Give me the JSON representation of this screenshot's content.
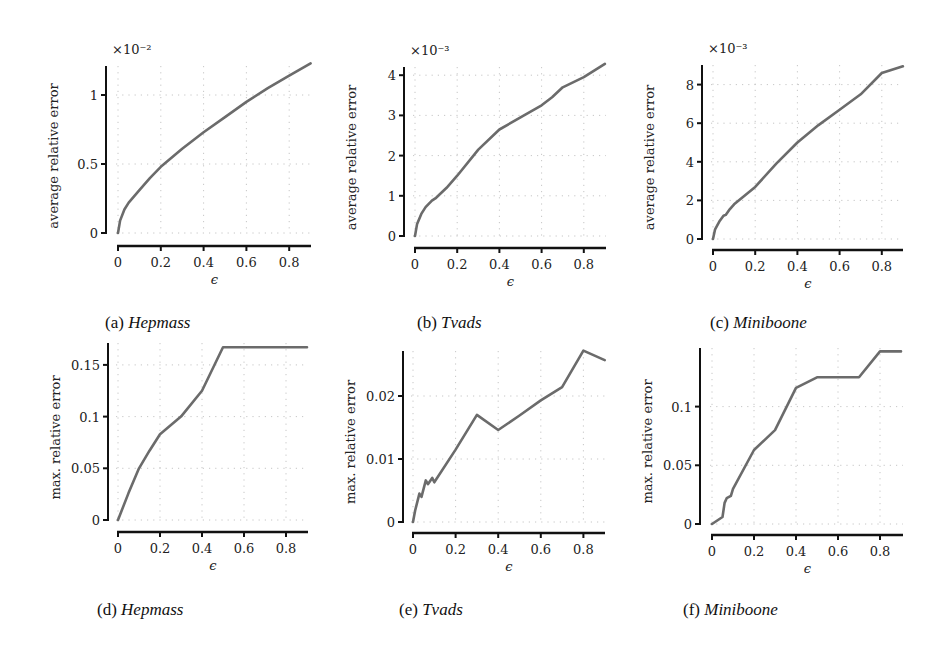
{
  "figure": {
    "panels": [
      {
        "id": "a",
        "caption_letter": "(a)",
        "caption_name": "Hepmass"
      },
      {
        "id": "b",
        "caption_letter": "(b)",
        "caption_name": "Tvads"
      },
      {
        "id": "c",
        "caption_letter": "(c)",
        "caption_name": "Miniboone"
      },
      {
        "id": "d",
        "caption_letter": "(d)",
        "caption_name": "Hepmass"
      },
      {
        "id": "e",
        "caption_letter": "(e)",
        "caption_name": "Tvads"
      },
      {
        "id": "f",
        "caption_letter": "(f)",
        "caption_name": "Miniboone"
      }
    ],
    "line_color": "#6b6b6b",
    "axis_color": "#111111",
    "grid_color": "#b8b8b8"
  },
  "chart_data": [
    {
      "panel": "a",
      "type": "line",
      "title": "(a) Hepmass",
      "xlabel": "ϵ",
      "ylabel": "average relative error",
      "y_multiplier": "×10⁻²",
      "xlim": [
        0,
        0.9
      ],
      "ylim": [
        0,
        1.21
      ],
      "xticks": [
        0,
        0.2,
        0.4,
        0.6,
        0.8
      ],
      "xtick_labels": [
        "0",
        "0.2",
        "0.4",
        "0.6",
        "0.8"
      ],
      "yticks": [
        0,
        0.5,
        1
      ],
      "ytick_labels": [
        "0",
        "0.5",
        "1"
      ],
      "grid": true,
      "series": [
        {
          "name": "Hepmass",
          "x": [
            0,
            0.01,
            0.03,
            0.05,
            0.1,
            0.15,
            0.2,
            0.3,
            0.4,
            0.5,
            0.6,
            0.7,
            0.8,
            0.9
          ],
          "y": [
            0,
            0.09,
            0.17,
            0.22,
            0.31,
            0.4,
            0.48,
            0.61,
            0.73,
            0.84,
            0.95,
            1.05,
            1.14,
            1.23
          ]
        }
      ]
    },
    {
      "panel": "b",
      "type": "line",
      "title": "(b) Tvads",
      "xlabel": "ϵ",
      "ylabel": "average relative error",
      "y_multiplier": "×10⁻³",
      "xlim": [
        0,
        0.9
      ],
      "ylim": [
        0,
        4.25
      ],
      "xticks": [
        0,
        0.2,
        0.4,
        0.6,
        0.8
      ],
      "xtick_labels": [
        "0",
        "0.2",
        "0.4",
        "0.6",
        "0.8"
      ],
      "yticks": [
        0,
        1,
        2,
        3,
        4
      ],
      "ytick_labels": [
        "0",
        "1",
        "2",
        "3",
        "4"
      ],
      "grid": true,
      "series": [
        {
          "name": "Tvads",
          "x": [
            0,
            0.01,
            0.03,
            0.05,
            0.08,
            0.1,
            0.15,
            0.2,
            0.3,
            0.4,
            0.5,
            0.6,
            0.65,
            0.7,
            0.8,
            0.9
          ],
          "y": [
            0,
            0.3,
            0.55,
            0.72,
            0.88,
            0.95,
            1.2,
            1.5,
            2.15,
            2.65,
            2.95,
            3.25,
            3.45,
            3.7,
            3.95,
            4.28
          ]
        }
      ]
    },
    {
      "panel": "c",
      "type": "line",
      "title": "(c) Miniboone",
      "xlabel": "ϵ",
      "ylabel": "average relative error",
      "y_multiplier": "×10⁻³",
      "xlim": [
        0,
        0.9
      ],
      "ylim": [
        0,
        9
      ],
      "xticks": [
        0,
        0.2,
        0.4,
        0.6,
        0.8
      ],
      "xtick_labels": [
        "0",
        "0.2",
        "0.4",
        "0.6",
        "0.8"
      ],
      "yticks": [
        0,
        2,
        4,
        6,
        8
      ],
      "ytick_labels": [
        "0",
        "2",
        "4",
        "6",
        "8"
      ],
      "grid": true,
      "series": [
        {
          "name": "Miniboone",
          "x": [
            0,
            0.01,
            0.03,
            0.05,
            0.06,
            0.08,
            0.1,
            0.2,
            0.3,
            0.4,
            0.5,
            0.6,
            0.7,
            0.8,
            0.9
          ],
          "y": [
            0,
            0.5,
            0.9,
            1.2,
            1.25,
            1.55,
            1.8,
            2.7,
            3.9,
            5.0,
            5.9,
            6.7,
            7.5,
            8.6,
            8.95
          ]
        }
      ]
    },
    {
      "panel": "d",
      "type": "line",
      "title": "(d) Hepmass",
      "xlabel": "ϵ",
      "ylabel": "max. relative error",
      "xlim": [
        0,
        0.9
      ],
      "ylim": [
        0,
        0.172
      ],
      "xticks": [
        0,
        0.2,
        0.4,
        0.6,
        0.8
      ],
      "xtick_labels": [
        "0",
        "0.2",
        "0.4",
        "0.6",
        "0.8"
      ],
      "yticks": [
        0,
        0.05,
        0.1,
        0.15
      ],
      "ytick_labels": [
        "0",
        "0.05",
        "0.1",
        "0.15"
      ],
      "grid": true,
      "series": [
        {
          "name": "Hepmass",
          "x": [
            0,
            0.05,
            0.1,
            0.15,
            0.2,
            0.3,
            0.4,
            0.5,
            0.6,
            0.7,
            0.8,
            0.9
          ],
          "y": [
            0,
            0.026,
            0.05,
            0.067,
            0.083,
            0.1,
            0.125,
            0.167,
            0.167,
            0.167,
            0.167,
            0.167
          ]
        }
      ]
    },
    {
      "panel": "e",
      "type": "line",
      "title": "(e) Tvads",
      "xlabel": "ϵ",
      "ylabel": "max. relative error",
      "xlim": [
        0,
        0.9
      ],
      "ylim": [
        0,
        0.0275
      ],
      "xticks": [
        0,
        0.2,
        0.4,
        0.6,
        0.8
      ],
      "xtick_labels": [
        "0",
        "0.2",
        "0.4",
        "0.6",
        "0.8"
      ],
      "yticks": [
        0,
        0.01,
        0.02
      ],
      "ytick_labels": [
        "0",
        "0.01",
        "0.02"
      ],
      "grid": true,
      "series": [
        {
          "name": "Tvads",
          "x": [
            0,
            0.01,
            0.03,
            0.04,
            0.06,
            0.07,
            0.09,
            0.1,
            0.2,
            0.3,
            0.4,
            0.5,
            0.6,
            0.7,
            0.8,
            0.9
          ],
          "y": [
            0,
            0.0018,
            0.0045,
            0.004,
            0.0066,
            0.006,
            0.007,
            0.0063,
            0.0115,
            0.017,
            0.0146,
            0.0169,
            0.0193,
            0.0214,
            0.0272,
            0.0257
          ]
        }
      ]
    },
    {
      "panel": "f",
      "type": "line",
      "title": "(f) Miniboone",
      "xlabel": "ϵ",
      "ylabel": "max. relative error",
      "xlim": [
        0,
        0.9
      ],
      "ylim": [
        0,
        0.15
      ],
      "xticks": [
        0,
        0.2,
        0.4,
        0.6,
        0.8
      ],
      "xtick_labels": [
        "0",
        "0.2",
        "0.4",
        "0.6",
        "0.8"
      ],
      "yticks": [
        0,
        0.05,
        0.1
      ],
      "ytick_labels": [
        "0",
        "0.05",
        "0.1"
      ],
      "grid": true,
      "series": [
        {
          "name": "Miniboone",
          "x": [
            0,
            0.05,
            0.06,
            0.07,
            0.09,
            0.1,
            0.2,
            0.3,
            0.4,
            0.5,
            0.6,
            0.7,
            0.8,
            0.9
          ],
          "y": [
            0,
            0.006,
            0.018,
            0.022,
            0.024,
            0.03,
            0.063,
            0.08,
            0.116,
            0.125,
            0.125,
            0.125,
            0.147,
            0.147
          ]
        }
      ]
    }
  ],
  "layout_px": {
    "a": {
      "x0": 118,
      "x_per_unit": 214,
      "y0": 233,
      "y_per_unit": 138,
      "axis_left": 106,
      "axis_top": 66,
      "axis_bottom": 246,
      "x_end": 311
    },
    "b": {
      "x0": 415,
      "x_per_unit": 211,
      "y0": 236,
      "y_per_unit": 40.2,
      "axis_left": 404,
      "axis_top": 67,
      "axis_bottom": 248,
      "x_end": 606
    },
    "c": {
      "x0": 713,
      "x_per_unit": 211,
      "y0": 239,
      "y_per_unit": 19.3,
      "axis_left": 702,
      "axis_top": 65,
      "axis_bottom": 250,
      "x_end": 903
    },
    "d": {
      "x0": 118,
      "x_per_unit": 210,
      "y0": 520,
      "y_per_unit": 1034,
      "axis_left": 108,
      "axis_top": 343,
      "axis_bottom": 532,
      "x_end": 308
    },
    "e": {
      "x0": 413,
      "x_per_unit": 213,
      "y0": 522,
      "y_per_unit": 6300,
      "axis_left": 403,
      "axis_top": 351,
      "axis_bottom": 533,
      "x_end": 605
    },
    "f": {
      "x0": 712,
      "x_per_unit": 210,
      "y0": 524,
      "y_per_unit": 1174,
      "axis_left": 700,
      "axis_top": 348,
      "axis_bottom": 535,
      "x_end": 903
    }
  },
  "captions_px": {
    "a": {
      "left": 105,
      "top": 313
    },
    "b": {
      "left": 417,
      "top": 313
    },
    "c": {
      "left": 710,
      "top": 313
    },
    "d": {
      "left": 97,
      "top": 600
    },
    "e": {
      "left": 399,
      "top": 600
    },
    "f": {
      "left": 683,
      "top": 600
    }
  }
}
